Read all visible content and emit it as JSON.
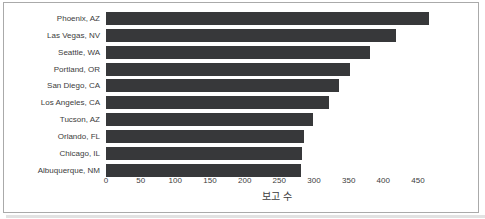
{
  "panel": {
    "background": "#ffffff",
    "border_color": "#aaaaaa",
    "shadow_color": "#e2e2e2"
  },
  "chart_data": {
    "type": "bar",
    "orientation": "horizontal",
    "title": "",
    "xlabel": "보고 수",
    "ylabel": "",
    "categories": [
      "Phoenix, AZ",
      "Las Vegas, NV",
      "Seattle, WA",
      "Portland, OR",
      "San Diego, CA",
      "Los Angeles, CA",
      "Tucson, AZ",
      "Orlando, FL",
      "Chicago, IL",
      "Albuquerque, NM"
    ],
    "values": [
      466,
      418,
      381,
      352,
      336,
      322,
      299,
      285,
      283,
      281
    ],
    "x_ticks": [
      0,
      50,
      100,
      150,
      200,
      250,
      300,
      350,
      400,
      450
    ],
    "xlim": [
      0,
      490
    ],
    "grid": false,
    "legend": null,
    "bar_color": "#37383a",
    "text_color": "#3c3c3c"
  }
}
